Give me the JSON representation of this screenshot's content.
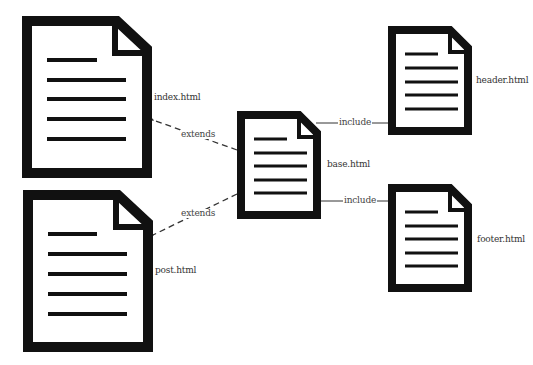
{
  "diagram": {
    "title": "",
    "nodes": [
      {
        "id": "index",
        "label": "index.html",
        "icon": "document-icon"
      },
      {
        "id": "post",
        "label": "post.html",
        "icon": "document-icon"
      },
      {
        "id": "base",
        "label": "base.html",
        "icon": "document-icon"
      },
      {
        "id": "header",
        "label": "header.html",
        "icon": "document-icon"
      },
      {
        "id": "footer",
        "label": "footer.html",
        "icon": "document-icon"
      }
    ],
    "edges": [
      {
        "from": "base",
        "to": "index",
        "label": "extends",
        "style": "dashed-arrow"
      },
      {
        "from": "base",
        "to": "post",
        "label": "extends",
        "style": "dashed-arrow"
      },
      {
        "from": "base",
        "to": "header",
        "label": "include",
        "style": "solid-line"
      },
      {
        "from": "base",
        "to": "footer",
        "label": "include",
        "style": "solid-line"
      }
    ],
    "colors": {
      "document_stroke": "#111111",
      "document_fill": "#ffffff",
      "edge": "#333333",
      "text": "#333333"
    }
  }
}
